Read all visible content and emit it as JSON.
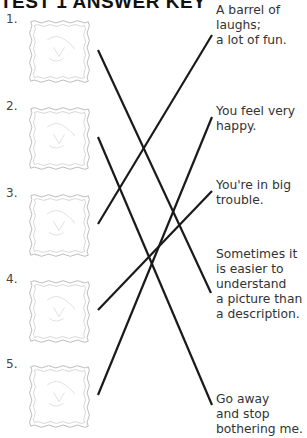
{
  "title": "TEST 1 ANSWER KEY",
  "items": [
    {
      "number": "1.",
      "picture": "boy with box on head",
      "top": 20
    },
    {
      "number": "2.",
      "picture": "kite girl",
      "top": 107
    },
    {
      "number": "3.",
      "picture": "children in barrel",
      "top": 194
    },
    {
      "number": "4.",
      "picture": "dog house",
      "top": 280
    },
    {
      "number": "5.",
      "picture": "cloud scene",
      "top": 365
    }
  ],
  "answers": [
    {
      "text": "A barrel of\nlaughs;\na lot of fun.",
      "top": 3
    },
    {
      "text": "You feel very\nhappy.",
      "top": 104
    },
    {
      "text": "You're in big\ntrouble.",
      "top": 178
    },
    {
      "text": "Sometimes it\nis easier to\nunderstand\na picture than\na description.",
      "top": 247
    },
    {
      "text": "Go away\nand stop\nbothering me.",
      "top": 392
    }
  ],
  "matches": [
    {
      "from": "1.",
      "to": "Sometimes it is easier to understand a picture than a description.",
      "x1": 98,
      "y1": 50,
      "x2": 211,
      "y2": 293
    },
    {
      "from": "2.",
      "to": "Go away and stop bothering me.",
      "x1": 98,
      "y1": 137,
      "x2": 212,
      "y2": 405
    },
    {
      "from": "3.",
      "to": "A barrel of laughs; a lot of fun.",
      "x1": 98,
      "y1": 224,
      "x2": 212,
      "y2": 35
    },
    {
      "from": "4.",
      "to": "You're in big trouble.",
      "x1": 98,
      "y1": 310,
      "x2": 212,
      "y2": 191
    },
    {
      "from": "5.",
      "to": "You feel very happy.",
      "x1": 98,
      "y1": 395,
      "x2": 212,
      "y2": 117
    }
  ]
}
